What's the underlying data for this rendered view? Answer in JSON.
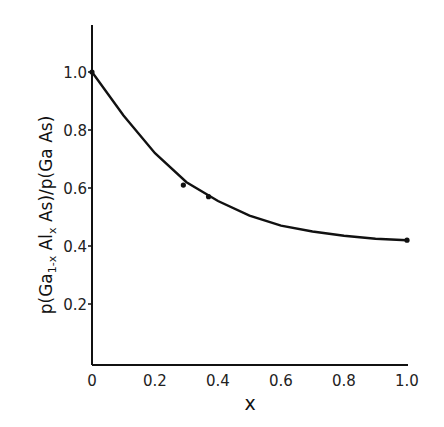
{
  "chart_data": {
    "type": "line",
    "title": "",
    "xlabel": "x",
    "ylabel": "p(Ga1-x Alx As)/p(Ga As)",
    "xlim": [
      0,
      1.0
    ],
    "ylim": [
      0,
      1.1
    ],
    "grid": false,
    "legend": null,
    "x_ticks": [
      "0",
      "0.2",
      "0.4",
      "0.6",
      "0.8",
      "1.0"
    ],
    "y_ticks": [
      "0.2",
      "0.4",
      "0.6",
      "0.8",
      "1.0"
    ],
    "series": [
      {
        "name": "curve",
        "x": [
          0,
          0.1,
          0.2,
          0.3,
          0.4,
          0.5,
          0.6,
          0.7,
          0.8,
          0.9,
          1.0
        ],
        "y": [
          1.0,
          0.85,
          0.72,
          0.62,
          0.555,
          0.505,
          0.47,
          0.45,
          0.435,
          0.425,
          0.42
        ]
      },
      {
        "name": "data points",
        "x": [
          0,
          0.29,
          0.37,
          1.0
        ],
        "y": [
          1.0,
          0.61,
          0.57,
          0.42
        ]
      }
    ]
  },
  "labels": {
    "ylabel_main": "p(Ga",
    "ylabel_sub1": "1-x",
    "ylabel_mid": " Al",
    "ylabel_sub2": "x",
    "ylabel_end": " As)/p(Ga As)",
    "xlabel": "x"
  }
}
